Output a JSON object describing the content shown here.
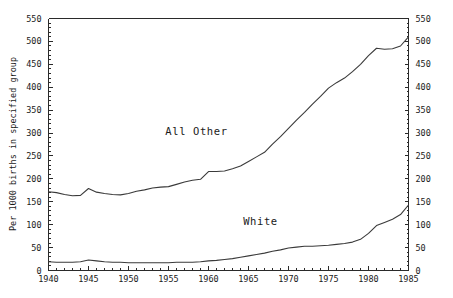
{
  "figure": {
    "title": "",
    "caption": ""
  },
  "chart_data": {
    "type": "line",
    "title": "",
    "xlabel": "",
    "ylabel": "Per 1000 births in specified group",
    "ylabel_right": "Per 1000 births in specified group",
    "xlim": [
      1940,
      1985
    ],
    "ylim": [
      0,
      550
    ],
    "grid": false,
    "legend": "inline-labels",
    "x_ticks": [
      1940,
      1945,
      1950,
      1955,
      1960,
      1965,
      1970,
      1975,
      1980,
      1985
    ],
    "x_tick_labels": [
      "1940",
      "1945",
      "1950",
      "1955",
      "1960",
      "1965",
      "1970",
      "1975",
      "1980",
      "1985"
    ],
    "x_minor_tick_step": 1,
    "y_ticks": [
      0,
      50,
      100,
      150,
      200,
      250,
      300,
      350,
      400,
      450,
      500,
      550
    ],
    "y_tick_labels": [
      "0",
      "50",
      "100",
      "150",
      "200",
      "250",
      "300",
      "350",
      "400",
      "450",
      "500",
      "550"
    ],
    "y_minor_tick_step": 10,
    "x": [
      1940,
      1941,
      1942,
      1943,
      1944,
      1945,
      1946,
      1947,
      1948,
      1949,
      1950,
      1951,
      1952,
      1953,
      1954,
      1955,
      1956,
      1957,
      1958,
      1959,
      1960,
      1961,
      1962,
      1963,
      1964,
      1965,
      1966,
      1967,
      1968,
      1969,
      1970,
      1971,
      1972,
      1973,
      1974,
      1975,
      1976,
      1977,
      1978,
      1979,
      1980,
      1981,
      1982,
      1983,
      1984,
      1985
    ],
    "series": [
      {
        "name": "All Other",
        "label": "All Other",
        "color": "#3a3a3a",
        "label_x": 1958.5,
        "label_y": 296,
        "values": [
          172,
          170,
          166,
          163,
          164,
          179,
          171,
          168,
          166,
          165,
          168,
          173,
          176,
          180,
          182,
          183,
          188,
          193,
          197,
          199,
          216,
          216,
          217,
          222,
          228,
          238,
          248,
          258,
          276,
          292,
          310,
          328,
          345,
          363,
          380,
          398,
          410,
          420,
          434,
          450,
          469,
          485,
          483,
          484,
          490,
          510
        ]
      },
      {
        "name": "White",
        "label": "White",
        "color": "#3a3a3a",
        "label_x": 1966.5,
        "label_y": 99,
        "values": [
          19,
          18,
          18,
          18,
          19,
          23,
          21,
          19,
          18,
          18,
          17,
          17,
          17,
          17,
          17,
          17,
          18,
          18,
          18,
          19,
          21,
          22,
          24,
          26,
          29,
          32,
          35,
          38,
          42,
          45,
          49,
          51,
          53,
          53,
          54,
          55,
          57,
          59,
          62,
          68,
          81,
          98,
          105,
          112,
          122,
          143
        ]
      }
    ]
  }
}
